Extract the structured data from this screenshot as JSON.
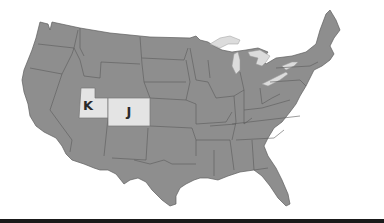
{
  "map": {
    "subject": "Contiguous United States",
    "highlighted_states": [
      {
        "label": "K",
        "state": "Utah"
      },
      {
        "label": "J",
        "state": "Colorado"
      }
    ],
    "colors": {
      "land": "#8e8e8e",
      "highlight": "#e4e4e4",
      "lakes": "#dcdcdc",
      "background": "#ffffff",
      "borders": "#5e5e5e"
    }
  },
  "labels": {
    "k": "K",
    "j": "J"
  }
}
